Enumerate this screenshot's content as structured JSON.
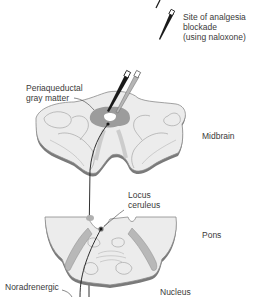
{
  "figure": {
    "legend": {
      "line1": "Site of analgesia",
      "line2": "blockade",
      "line3": "(using naloxone)"
    },
    "labels": {
      "pag_line1": "Periaqueductal",
      "pag_line2": "gray matter",
      "midbrain": "Midbrain",
      "lc_line1": "Locus",
      "lc_line2": "ceruleus",
      "pons": "Pons",
      "noradrenergic": "Noradrenergic",
      "nucleus": "Nucleus"
    },
    "colors": {
      "tissue_fill": "#ececec",
      "tissue_edge": "#8a8a8a",
      "pag_gray": "#9c9c9c",
      "electrode_dark": "#1a1a1a",
      "electrode_light": "#b5b5b5",
      "tract_highlight": "#c4c4c4"
    }
  }
}
